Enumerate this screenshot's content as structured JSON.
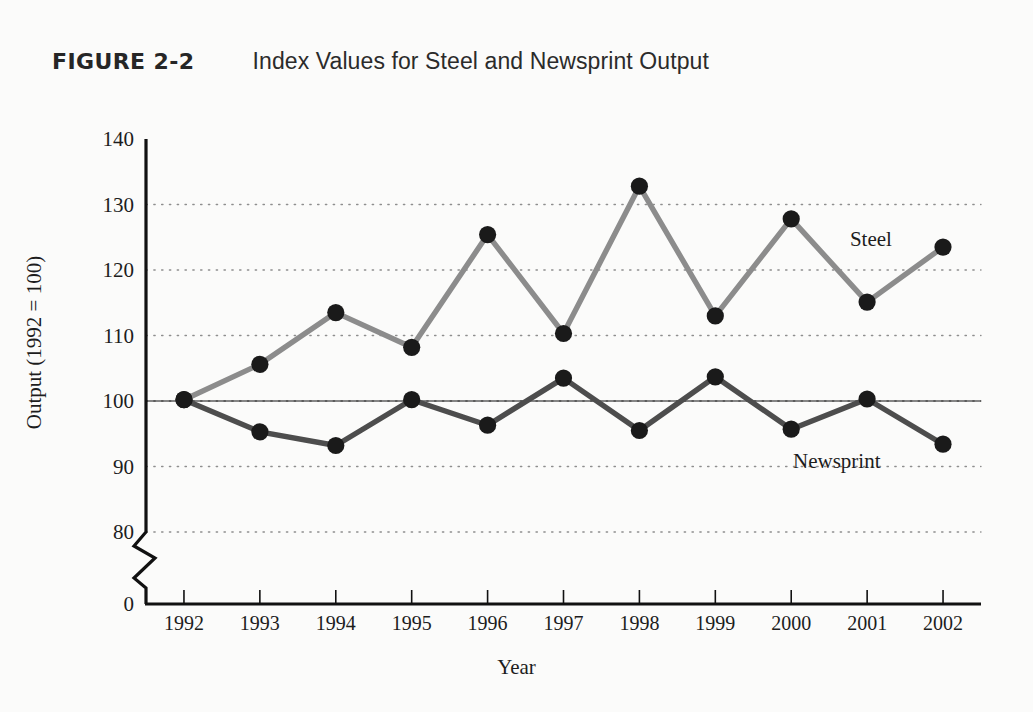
{
  "figure": {
    "number": "FIGURE 2-2",
    "title": "Index Values for Steel and Newsprint Output"
  },
  "chart_data": {
    "type": "line",
    "title": "Index Values for Steel and Newsprint Output",
    "xlabel": "Year",
    "ylabel": "Output (1992 = 100)",
    "categories": [
      "1992",
      "1993",
      "1994",
      "1995",
      "1996",
      "1997",
      "1998",
      "1999",
      "2000",
      "2001",
      "2002"
    ],
    "x": [
      1992,
      1993,
      1994,
      1995,
      1996,
      1997,
      1998,
      1999,
      2000,
      2001,
      2002
    ],
    "ylim": [
      80,
      140
    ],
    "y_axis_break": true,
    "y_axis_break_label": "0",
    "yticks": [
      140,
      130,
      120,
      110,
      100,
      90,
      80
    ],
    "grid": true,
    "grid_style": "dotted-horizontal",
    "reference_line": 100,
    "legend": "inline-labels",
    "series": [
      {
        "name": "Steel",
        "color": "#8c8c8c",
        "marker_color": "#1a1a1a",
        "label_x": 2001.05,
        "label_y": 124.5,
        "values": [
          100.2,
          105.6,
          113.5,
          108.2,
          125.4,
          110.3,
          132.8,
          113.0,
          127.8,
          115.1,
          123.5
        ]
      },
      {
        "name": "Newsprint",
        "color": "#4d4d4d",
        "marker_color": "#1a1a1a",
        "label_x": 2000.6,
        "label_y": 90.6,
        "values": [
          100.2,
          95.3,
          93.2,
          100.2,
          96.3,
          103.5,
          95.5,
          103.7,
          95.7,
          100.3,
          93.4
        ]
      }
    ]
  }
}
